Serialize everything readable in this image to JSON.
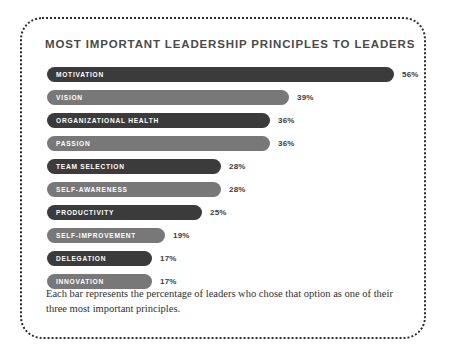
{
  "figure": {
    "title": "MOST IMPORTANT LEADERSHIP PRINCIPLES TO LEADERS",
    "caption": "Each bar represents the percentage of leaders who chose that option as one of their three most important principles.",
    "border_color": "#2b2b2b",
    "background": "#ffffff"
  },
  "chart_data": {
    "type": "bar",
    "orientation": "horizontal",
    "title": "MOST IMPORTANT LEADERSHIP PRINCIPLES TO LEADERS",
    "xlabel": "",
    "ylabel": "",
    "xlim": [
      0,
      56
    ],
    "grid": false,
    "legend": "none",
    "value_suffix": "%",
    "categories": [
      "MOTIVATION",
      "VISION",
      "ORGANIZATIONAL HEALTH",
      "PASSION",
      "TEAM SELECTION",
      "SELF-AWARENESS",
      "PRODUCTIVITY",
      "SELF-IMPROVEMENT",
      "DELEGATION",
      "INNOVATION"
    ],
    "values": [
      56,
      39,
      36,
      36,
      28,
      28,
      25,
      19,
      17,
      17
    ],
    "value_labels": [
      "56%",
      "39%",
      "36%",
      "36%",
      "28%",
      "28%",
      "25%",
      "19%",
      "17%",
      "17%"
    ],
    "bar_colors": [
      "#3b3b3b",
      "#787878",
      "#3b3b3b",
      "#787878",
      "#3b3b3b",
      "#787878",
      "#3b3b3b",
      "#787878",
      "#3b3b3b",
      "#787878"
    ],
    "label_color": "#ffffff",
    "value_color": "#3b3b3b"
  }
}
